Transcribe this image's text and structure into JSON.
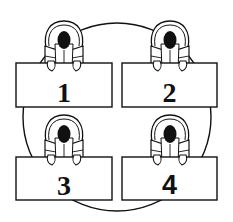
{
  "diagram": {
    "type": "seating-arrangement",
    "colors": {
      "stroke": "#111111",
      "background": "#ffffff",
      "head": "#111111"
    },
    "table": {
      "shape": "circle",
      "cx": 117,
      "cy": 117,
      "r": 94
    },
    "desks": [
      {
        "id": 1,
        "label": "1",
        "x": 16,
        "y": 63,
        "w": 96,
        "h": 44,
        "font": "serif"
      },
      {
        "id": 2,
        "label": "2",
        "x": 122,
        "y": 63,
        "w": 95,
        "h": 44,
        "font": "serif"
      },
      {
        "id": 3,
        "label": "3",
        "x": 16,
        "y": 157,
        "w": 96,
        "h": 43,
        "font": "serif"
      },
      {
        "id": 4,
        "label": "4",
        "x": 122,
        "y": 157,
        "w": 95,
        "h": 43,
        "font": "sans"
      }
    ],
    "people": [
      {
        "seat": 1,
        "cx": 64,
        "cy": 22
      },
      {
        "seat": 2,
        "cx": 170,
        "cy": 22
      },
      {
        "seat": 3,
        "cx": 64,
        "cy": 116
      },
      {
        "seat": 4,
        "cx": 170,
        "cy": 116
      }
    ]
  }
}
